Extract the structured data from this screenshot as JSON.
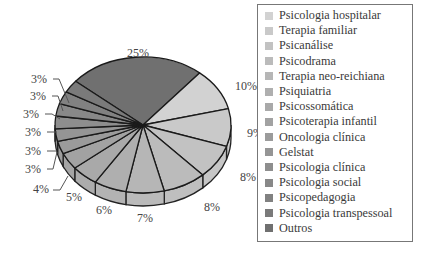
{
  "chart_data": {
    "type": "pie",
    "style": "3d-exploded-none",
    "title": "",
    "categories": [
      "Psicologia hospitalar",
      "Terapia familiar",
      "Psicanálise",
      "Psicodrama",
      "Terapia neo-reichiana",
      "Psiquiatria",
      "Psicossomática",
      "Psicoterapia infantil",
      "Oncologia clínica",
      "Gelstat",
      "Psicologia clínica",
      "Psicologia social",
      "Psicopedagogia",
      "Psicologia transpessoal",
      "Outros"
    ],
    "values": [
      10,
      9,
      8,
      8,
      7,
      6,
      5,
      4,
      3,
      3,
      3,
      3,
      3,
      3,
      25
    ],
    "labels": [
      "10%",
      "9%",
      "8%",
      "8%",
      "7%",
      "6%",
      "5%",
      "4%",
      "3%",
      "3%",
      "3%",
      "3%",
      "3%",
      "3%",
      "25%"
    ],
    "colors": [
      "#d2d2d2",
      "#c9c9c9",
      "#c2c2c2",
      "#bbbbbb",
      "#b6b6b6",
      "#afafaf",
      "#a9a9a9",
      "#a2a2a2",
      "#9b9b9b",
      "#959595",
      "#8e8e8e",
      "#888888",
      "#818181",
      "#7a7a7a",
      "#707070"
    ],
    "legend_position": "right",
    "units": "%"
  },
  "legend": {
    "items": [
      {
        "label": "Psicologia hospitalar",
        "color": "#d2d2d2"
      },
      {
        "label": "Terapia familiar",
        "color": "#c9c9c9"
      },
      {
        "label": "Psicanálise",
        "color": "#c2c2c2"
      },
      {
        "label": "Psicodrama",
        "color": "#bbbbbb"
      },
      {
        "label": "Terapia neo-reichiana",
        "color": "#b6b6b6"
      },
      {
        "label": "Psiquiatria",
        "color": "#afafaf"
      },
      {
        "label": "Psicossomática",
        "color": "#a9a9a9"
      },
      {
        "label": "Psicoterapia infantil",
        "color": "#a2a2a2"
      },
      {
        "label": "Oncologia clínica",
        "color": "#9b9b9b"
      },
      {
        "label": "Gelstat",
        "color": "#959595"
      },
      {
        "label": "Psicologia clínica",
        "color": "#8e8e8e"
      },
      {
        "label": "Psicologia social",
        "color": "#888888"
      },
      {
        "label": "Psicopedagogia",
        "color": "#818181"
      },
      {
        "label": "Psicologia transpessoal",
        "color": "#7a7a7a"
      },
      {
        "label": "Outros",
        "color": "#707070"
      }
    ]
  }
}
